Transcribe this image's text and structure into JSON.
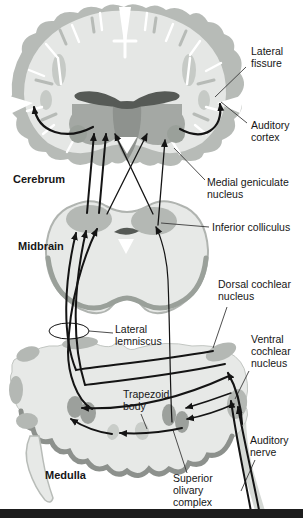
{
  "diagram": {
    "regions": {
      "cerebrum": "Cerebrum",
      "midbrain": "Midbrain",
      "medulla": "Medulla"
    },
    "labels": {
      "lateral_fissure": "Lateral\nfissure",
      "auditory_cortex": "Auditory\ncortex",
      "medial_geniculate": "Medial geniculate\nnucleus",
      "inferior_colliculus": "Inferior colliculus",
      "dorsal_cochlear": "Dorsal cochlear\nnucleus",
      "lateral_lemniscus": "Lateral\nlemniscus",
      "ventral_cochlear": "Ventral\ncochlear\nnucleus",
      "trapezoid_body": "Trapezoid\nbody",
      "auditory_nerve": "Auditory\nnerve",
      "superior_olivary": "Superior\nolivary\ncomplex"
    },
    "colors": {
      "background": "#ffffff",
      "cortex_gray": "#b7bbb7",
      "tissue_light": "#e5e7e5",
      "nucleus_gray": "#b4b8b4",
      "thalamus_gray": "#a4a8a4",
      "deep_gray": "#565a56",
      "shadow_gray": "#8d918d",
      "line_black": "#141414",
      "footer_bar": "#1d1d1d"
    }
  }
}
